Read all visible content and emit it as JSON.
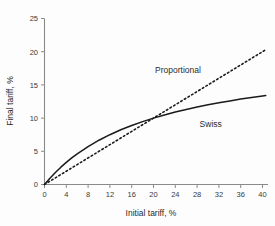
{
  "chart_data": {
    "type": "line",
    "title": "",
    "xlabel": "Initial tariff, %",
    "ylabel": "Final tariff, %",
    "xlim": [
      0,
      41
    ],
    "ylim": [
      0,
      25
    ],
    "xticks": [
      0,
      4,
      8,
      12,
      16,
      20,
      24,
      28,
      32,
      36,
      40
    ],
    "yticks": [
      0,
      5,
      10,
      15,
      20,
      25
    ],
    "xtick_labels": [
      "0",
      "4",
      "8",
      "12",
      "16",
      "20",
      "24",
      "28",
      "32",
      "36",
      "40"
    ],
    "ytick_labels": [
      "0",
      "5",
      "10",
      "15",
      "20",
      "25"
    ],
    "grid": false,
    "legend_position": "inline-annotation",
    "series": [
      {
        "name": "Proportional",
        "style": "dashed",
        "color": "#1a1a1a",
        "label_x": 24.5,
        "label_y": 16.8,
        "x": [
          0,
          2,
          4,
          6,
          8,
          10,
          12,
          14,
          16,
          18,
          20,
          22,
          24,
          26,
          28,
          30,
          32,
          34,
          36,
          38,
          40,
          40.6
        ],
        "values": [
          0,
          1,
          2,
          3,
          4,
          5,
          6,
          7,
          8,
          9,
          10,
          11,
          12,
          13,
          14,
          15,
          16,
          17,
          18,
          19,
          20,
          20.3
        ]
      },
      {
        "name": "Swiss",
        "style": "solid",
        "color": "#1a1a1a",
        "label_x": 30.5,
        "label_y": 8.6,
        "x": [
          0,
          1,
          2,
          3,
          4,
          5,
          6,
          8,
          10,
          12,
          14,
          16,
          18,
          20,
          22,
          24,
          26,
          28,
          30,
          32,
          34,
          36,
          38,
          40,
          40.6
        ],
        "values": [
          0,
          0.95,
          1.82,
          2.61,
          3.33,
          4.0,
          4.62,
          5.71,
          6.67,
          7.5,
          8.24,
          8.89,
          9.47,
          10.0,
          10.48,
          10.91,
          11.3,
          11.67,
          12.0,
          12.31,
          12.59,
          12.86,
          13.1,
          13.33,
          13.4
        ]
      }
    ],
    "annotations": [
      {
        "text": "Proportional",
        "x": 24.5,
        "y": 16.8
      },
      {
        "text": "Swiss",
        "x": 30.5,
        "y": 8.6
      }
    ]
  },
  "figure": {
    "background_color": "#fdfdfd",
    "axis_color": "#8a8a8a",
    "ink_color": "#1a1a1a"
  }
}
